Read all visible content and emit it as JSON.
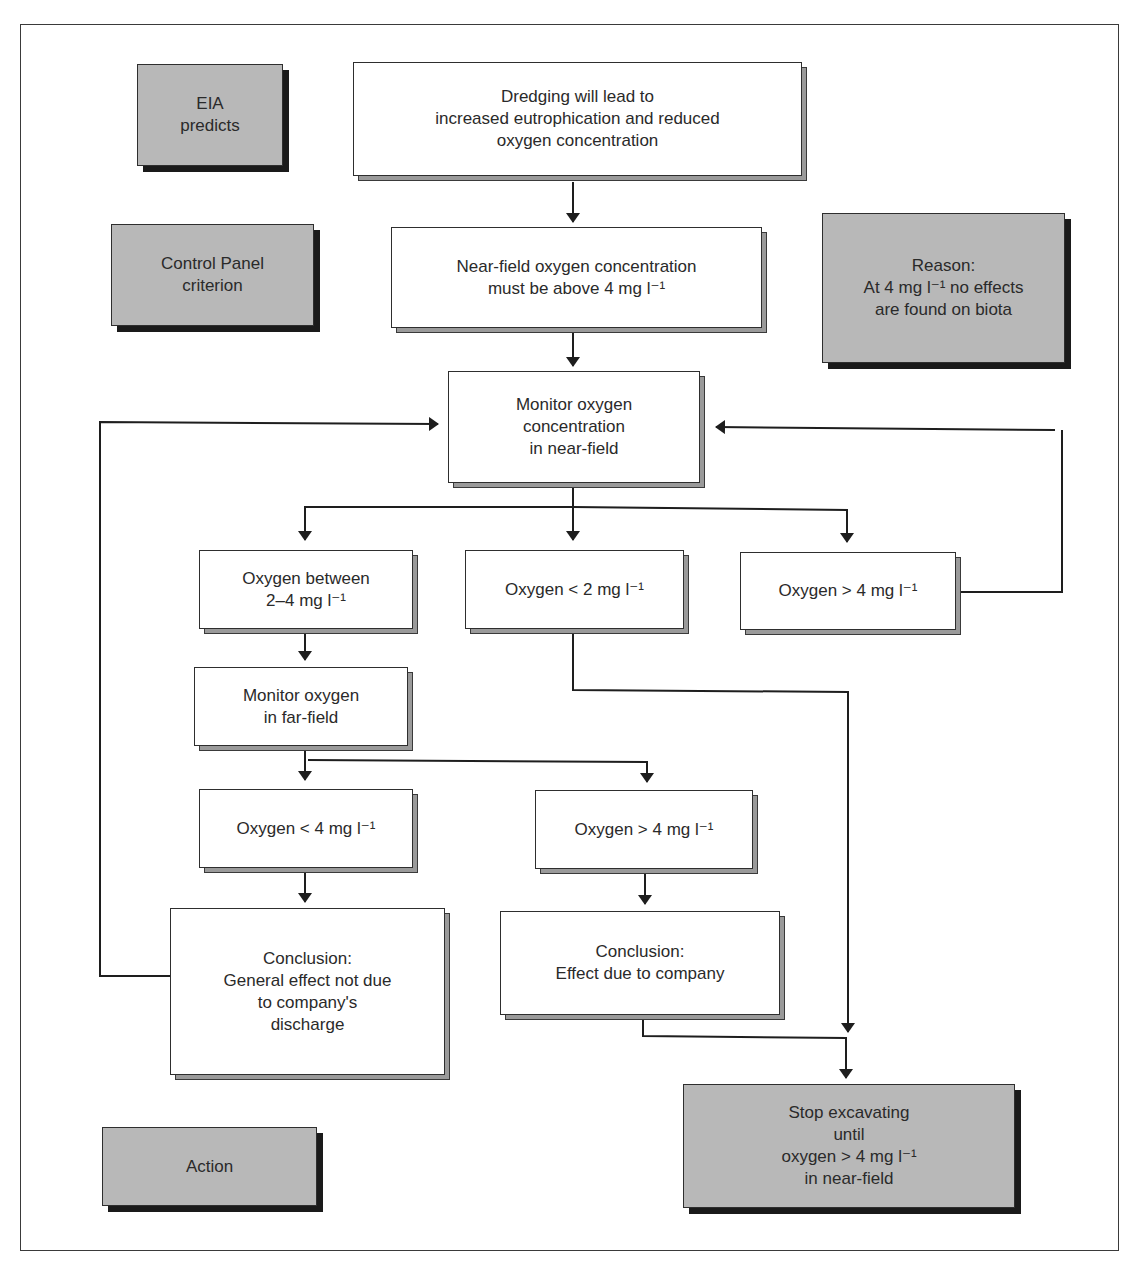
{
  "diagram": {
    "type": "flowchart",
    "legend_boxes": {
      "eia_predicts": {
        "label": "EIA\npredicts"
      },
      "control_panel_criterion": {
        "label": "Control Panel\ncriterion"
      },
      "reason": {
        "label": "Reason:\nAt 4 mg l⁻¹ no effects\nare found on biota"
      },
      "action": {
        "label": "Action"
      }
    },
    "nodes": {
      "dredging": {
        "label": "Dredging will lead to\nincreased eutrophication and reduced\noxygen concentration"
      },
      "criterion": {
        "label": "Near-field oxygen concentration\nmust be above 4 mg l⁻¹"
      },
      "monitor_near": {
        "label": "Monitor oxygen\nconcentration\nin near-field"
      },
      "oxygen_2_4": {
        "label": "Oxygen between\n2–4 mg l⁻¹"
      },
      "oxygen_lt2": {
        "label": "Oxygen < 2 mg l⁻¹"
      },
      "oxygen_gt4_near": {
        "label": "Oxygen > 4 mg l⁻¹"
      },
      "monitor_far": {
        "label": "Monitor oxygen\nin far-field"
      },
      "oxygen_lt4_far": {
        "label": "Oxygen < 4 mg l⁻¹"
      },
      "oxygen_gt4_far": {
        "label": "Oxygen > 4 mg l⁻¹"
      },
      "conclusion_not_company": {
        "label": "Conclusion:\nGeneral effect not due\nto company's\ndischarge"
      },
      "conclusion_company": {
        "label": "Conclusion:\nEffect due to company"
      },
      "stop_excavating": {
        "label": "Stop excavating\nuntil\noxygen > 4 mg l⁻¹\nin near-field"
      }
    },
    "colors": {
      "action_fill": "#b8b8b8",
      "node_fill": "#ffffff",
      "line": "#1e1e1e"
    }
  }
}
